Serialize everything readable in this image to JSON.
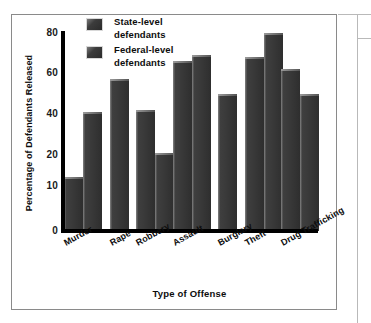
{
  "chart_data": {
    "type": "bar",
    "title": "",
    "xlabel": "Type of Offense",
    "ylabel": "Percentage of Defendants Released",
    "categories": [
      "Murder",
      "Rape",
      "Robbery",
      "Assault",
      "Burglary",
      "Theft",
      "Drug Trafficking"
    ],
    "series": [
      {
        "name": "State-level defendants",
        "values": [
          13,
          null,
          42,
          66,
          null,
          68,
          62
        ]
      },
      {
        "name": "Federal-level defendants",
        "values": [
          41,
          57,
          21,
          69,
          50,
          80,
          50
        ]
      }
    ],
    "ylim": [
      0,
      80
    ],
    "yticks": [
      0,
      10,
      20,
      40,
      60,
      80
    ],
    "ytick_labels": [
      "0",
      "10",
      "20",
      "40",
      "60",
      "80"
    ],
    "ytick_pixels": [
      231,
      186,
      155,
      114,
      73,
      33
    ],
    "grid": false,
    "legend_position": "top-left",
    "bar_color": "#3a3a3a",
    "axis_color": "#000000",
    "frame_color": "#8a8a8a",
    "note": "Non-uniform y-axis: 0-10 and 10-20 intervals are compressed relative to 20-40-60-80."
  },
  "legend": {
    "items": [
      {
        "label_line1": "State-level",
        "label_line2": "defendants"
      },
      {
        "label_line1": "Federal-level",
        "label_line2": "defendants"
      }
    ]
  },
  "axes": {
    "y_title": "Percentage of Defendants Released",
    "x_title": "Type of Offense"
  }
}
